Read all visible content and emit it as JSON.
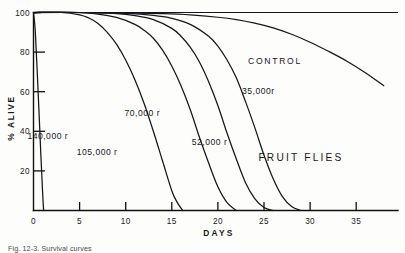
{
  "figure": {
    "title_annotation": "FRUIT FLIES",
    "control_label": "CONTROL",
    "caption": "Fig. 12-3.  Survival curves",
    "ink_color": "#15161a",
    "background": "#fdfdfc"
  },
  "chart_data": {
    "type": "line",
    "title": "FRUIT FLIES",
    "xlabel": "DAYS",
    "ylabel": "% ALIVE",
    "xlim": [
      0,
      38
    ],
    "ylim": [
      0,
      100
    ],
    "xticks": [
      0,
      5,
      10,
      15,
      20,
      25,
      30,
      35
    ],
    "xtick_labels": [
      "0",
      "5",
      "10",
      "15",
      "20",
      "25",
      "30",
      "35"
    ],
    "yticks": [
      0,
      20,
      40,
      60,
      80,
      100
    ],
    "ytick_labels": [
      "0",
      "20",
      "40",
      "60",
      "80",
      "100"
    ],
    "grid": false,
    "legend": "inline-curve-labels",
    "series": [
      {
        "name": "CONTROL",
        "label": "CONTROL",
        "label_x": 26.2,
        "label_y": 74,
        "x": [
          0,
          5,
          10,
          14,
          17,
          20,
          22,
          24,
          26,
          28,
          30,
          32,
          34,
          36,
          38
        ],
        "y": [
          100,
          100,
          99.8,
          99.4,
          98.8,
          97.6,
          96.4,
          94.6,
          92.2,
          89,
          85,
          80.4,
          75.4,
          69.6,
          63
        ]
      },
      {
        "name": "35,000 r",
        "label": "35,000r",
        "label_x": 24.4,
        "label_y": 59,
        "x": [
          0,
          5,
          10,
          13,
          15,
          17,
          19,
          20,
          21,
          22,
          23,
          24,
          25,
          26,
          27,
          28,
          29
        ],
        "y": [
          100,
          100,
          99.5,
          98.5,
          97,
          94,
          88,
          83,
          76,
          67,
          55,
          42,
          28,
          16,
          7,
          2,
          0
        ]
      },
      {
        "name": "52,000 r",
        "label": "52,000 r",
        "label_x": 19.1,
        "label_y": 33,
        "x": [
          0,
          5,
          9,
          11,
          13,
          15,
          16,
          17,
          18,
          19,
          20,
          21,
          22,
          23,
          24,
          25,
          26
        ],
        "y": [
          100,
          100,
          99.4,
          98.4,
          96.4,
          92,
          88,
          82.5,
          75,
          65,
          53,
          39,
          26,
          14,
          6,
          1.5,
          0
        ]
      },
      {
        "name": "70,000 r",
        "label": "70,000 r",
        "label_x": 11.8,
        "label_y": 48,
        "x": [
          0,
          4,
          7,
          9,
          11,
          12,
          13,
          14,
          15,
          16,
          17,
          18,
          19,
          20,
          21,
          22
        ],
        "y": [
          100,
          100,
          99.2,
          97.5,
          94,
          91,
          87,
          81,
          73,
          63,
          51,
          37,
          24,
          12,
          4,
          0
        ]
      },
      {
        "name": "105,000 r",
        "label": "105,000 r",
        "label_x": 6.9,
        "label_y": 28,
        "x": [
          0,
          3,
          5,
          6,
          7,
          8,
          9,
          10,
          11,
          12,
          13,
          14,
          15,
          15.6,
          16.2
        ],
        "y": [
          100,
          100,
          98.8,
          97.2,
          94.5,
          90,
          84,
          76,
          66,
          54,
          40,
          25,
          10,
          4,
          0
        ]
      },
      {
        "name": "140,000 r",
        "label": "140,000 r",
        "label_x": 1.55,
        "label_y": 36,
        "x": [
          0,
          0.2,
          0.5,
          0.8,
          1.0,
          1.1
        ],
        "y": [
          100,
          90,
          60,
          28,
          8,
          0
        ]
      }
    ]
  }
}
